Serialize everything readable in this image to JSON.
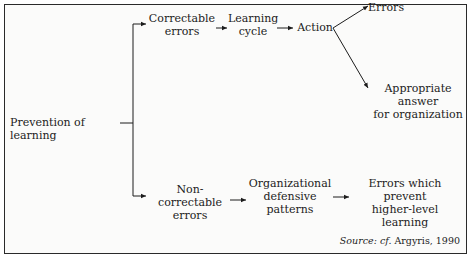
{
  "diagram": {
    "root": "Prevention of learning",
    "branch_top": {
      "label": "Correctable\nerrors",
      "step1": "Learning\ncycle",
      "step2": "Action",
      "outcome_a": "Errors",
      "outcome_b": "Appropriate answer\nfor organization"
    },
    "branch_bottom": {
      "label": "Non-correctable\nerrors",
      "step1": "Organizational\ndefensive\npatterns",
      "step2": "Errors which prevent\nhigher-level\nlearning"
    },
    "source_prefix": "Source: cf.",
    "source_text": "Argyris, 1990"
  },
  "colors": {
    "line": "#1c1c1c",
    "background": "#fbfbfa"
  }
}
